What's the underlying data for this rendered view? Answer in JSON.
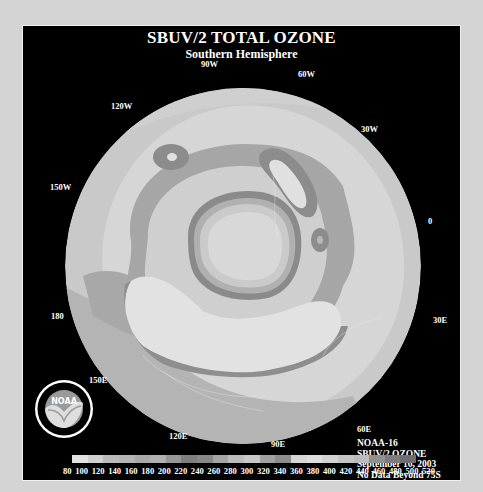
{
  "title": "SBUV/2 TOTAL OZONE",
  "subtitle": "Southern Hemisphere",
  "longitude_labels": [
    {
      "text": "90W",
      "x": 178,
      "y": 33
    },
    {
      "text": "60W",
      "x": 275,
      "y": 43
    },
    {
      "text": "120W",
      "x": 88,
      "y": 75
    },
    {
      "text": "30W",
      "x": 338,
      "y": 98
    },
    {
      "text": "150W",
      "x": 27,
      "y": 156
    },
    {
      "text": "0",
      "x": 405,
      "y": 190
    },
    {
      "text": "180",
      "x": 28,
      "y": 285
    },
    {
      "text": "30E",
      "x": 410,
      "y": 289
    },
    {
      "text": "150E",
      "x": 66,
      "y": 349
    },
    {
      "text": "60E",
      "x": 334,
      "y": 398
    },
    {
      "text": "120E",
      "x": 146,
      "y": 405
    },
    {
      "text": "90E",
      "x": 248,
      "y": 413
    }
  ],
  "info": {
    "satellite": "NOAA-16",
    "product": "SBUV/2 OZONE",
    "date": "September 16, 2003",
    "note": "No Data Beyond 75S"
  },
  "logo": {
    "text": "NOAA"
  },
  "colorbar": {
    "ticks": [
      "80",
      "100",
      "120",
      "140",
      "160",
      "180",
      "200",
      "220",
      "240",
      "260",
      "280",
      "300",
      "320",
      "340",
      "360",
      "380",
      "400",
      "420",
      "440",
      "460",
      "480",
      "500",
      "520"
    ],
    "colors": [
      "#e2e2e2",
      "#d0d0d0",
      "#bababa",
      "#b4b4b4",
      "#a8a8a8",
      "#b0b0b0",
      "#969696",
      "#7e7e7e",
      "#888888",
      "#a4a4a4",
      "#bcbcbc",
      "#c8c8c8",
      "#a0a0a0",
      "#8c8c8c",
      "#d6d6d6",
      "#dedede",
      "#d2d2d2",
      "#c4c4c4",
      "#bcbcbc",
      "#909090",
      "#7c7c7c",
      "#6e6e6e"
    ]
  },
  "colors": {
    "background": "#d4d4d4",
    "panel": "#000000",
    "text": "#ffffff"
  }
}
